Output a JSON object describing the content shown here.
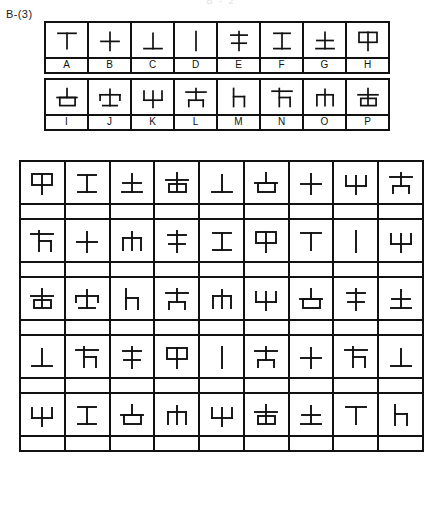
{
  "page": {
    "cropped_header_text": "B - 2",
    "section_label": "B-(3)"
  },
  "legend": {
    "title_visible": false,
    "rows": [
      {
        "letters": [
          "A",
          "B",
          "C",
          "D",
          "E",
          "F",
          "G",
          "H"
        ],
        "symbols": [
          "tee-down",
          "plus",
          "tee-up",
          "vertical-bar",
          "double-cross-high",
          "i-beam",
          "cross-on-base",
          "boxed-tee"
        ]
      },
      {
        "letters": [
          "I",
          "J",
          "K",
          "L",
          "M",
          "N",
          "O",
          "P"
        ],
        "symbols": [
          "box-on-stem-low",
          "t-with-wide-cap",
          "psi-fork",
          "t-with-short-legs",
          "h-small-right",
          "flag-right-leg",
          "pi-arch",
          "box-on-stem-high"
        ]
      }
    ]
  },
  "main_grid": {
    "columns": 9,
    "rows": [
      {
        "symbols": [
          "H",
          "F",
          "G",
          "P",
          "C",
          "I",
          "B",
          "K",
          "L"
        ],
        "answers": [
          "",
          "",
          "",
          "",
          "",
          "",
          "",
          "",
          ""
        ]
      },
      {
        "symbols": [
          "N",
          "B",
          "O",
          "E",
          "F",
          "H",
          "A",
          "D",
          "K"
        ],
        "answers": [
          "",
          "",
          "",
          "",
          "",
          "",
          "",
          "",
          ""
        ]
      },
      {
        "symbols": [
          "P",
          "J",
          "M",
          "L",
          "O",
          "K",
          "I",
          "E",
          "G"
        ],
        "answers": [
          "",
          "",
          "",
          "",
          "",
          "",
          "",
          "",
          ""
        ]
      },
      {
        "symbols": [
          "C",
          "N",
          "E",
          "H",
          "D",
          "L",
          "B",
          "N",
          "C"
        ],
        "answers": [
          "",
          "",
          "",
          "",
          "",
          "",
          "",
          "",
          ""
        ]
      },
      {
        "symbols": [
          "K",
          "F",
          "I",
          "O",
          "K",
          "P",
          "G",
          "A",
          "M"
        ],
        "answers": [
          "",
          "",
          "",
          "",
          "",
          "",
          "",
          "",
          ""
        ]
      }
    ]
  },
  "symbol_key": {
    "A": "tee-down",
    "B": "plus",
    "C": "tee-up",
    "D": "vertical-bar",
    "E": "double-cross-high",
    "F": "i-beam",
    "G": "cross-on-base",
    "H": "boxed-tee",
    "I": "box-on-stem-low",
    "J": "t-with-wide-cap",
    "K": "psi-fork",
    "L": "t-with-short-legs",
    "M": "h-small-right",
    "N": "flag-right-leg",
    "O": "pi-arch",
    "P": "box-on-stem-high"
  },
  "colors": {
    "ink": "#111111",
    "paper": "#ffffff"
  }
}
